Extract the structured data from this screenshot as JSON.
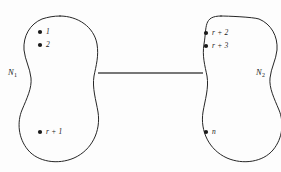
{
  "figure": {
    "background_color": "#fdfdfd",
    "outline_color": "#262626",
    "link_color": "#4a4a4a",
    "dot_color": "#1a1a1a"
  },
  "regions": [
    {
      "id": "region-left",
      "label_text": "N",
      "label_sub": "1",
      "label_x": 8,
      "label_y": 68
    },
    {
      "id": "region-right",
      "label_text": "N",
      "label_sub": "2",
      "label_x": 256,
      "label_y": 68
    }
  ],
  "nodes": [
    {
      "id": "node-1",
      "region": "region-left",
      "label": "1",
      "dot_x": 40,
      "dot_y": 32,
      "label_x": 46,
      "label_y": 28
    },
    {
      "id": "node-2",
      "region": "region-left",
      "label": "2",
      "dot_x": 40,
      "dot_y": 45,
      "label_x": 46,
      "label_y": 41
    },
    {
      "id": "node-r1",
      "region": "region-left",
      "label": "r + 1",
      "dot_x": 40,
      "dot_y": 132,
      "label_x": 46,
      "label_y": 128
    },
    {
      "id": "node-r2",
      "region": "region-right",
      "label": "r + 2",
      "dot_x": 206,
      "dot_y": 33,
      "label_x": 212,
      "label_y": 29
    },
    {
      "id": "node-r3",
      "region": "region-right",
      "label": "r + 3",
      "dot_x": 206,
      "dot_y": 46,
      "label_x": 212,
      "label_y": 42
    },
    {
      "id": "node-n",
      "region": "region-right",
      "label": "n",
      "dot_x": 206,
      "dot_y": 132,
      "label_x": 212,
      "label_y": 128
    }
  ],
  "link": {
    "id": "inter-region-link",
    "x1": 98,
    "y1": 73,
    "x2": 203,
    "y2": 73
  }
}
